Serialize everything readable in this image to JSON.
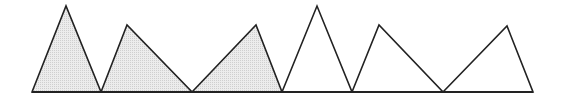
{
  "diagram": {
    "width": 562,
    "height": 105,
    "background": "#ffffff",
    "stroke_color": "#222222",
    "shaded_fill": "#e2e2e2",
    "unshaded_fill": "#ffffff",
    "baseline": {
      "x1": 32,
      "x2": 533,
      "y": 92
    },
    "triangles": [
      {
        "id": 1,
        "shaded": true,
        "points": [
          [
            32,
            92
          ],
          [
            66,
            6
          ],
          [
            101,
            92
          ]
        ]
      },
      {
        "id": 2,
        "shaded": true,
        "points": [
          [
            101,
            92
          ],
          [
            127,
            25
          ],
          [
            192,
            92
          ]
        ]
      },
      {
        "id": 3,
        "shaded": true,
        "points": [
          [
            192,
            92
          ],
          [
            256,
            25
          ],
          [
            282,
            92
          ]
        ]
      },
      {
        "id": 4,
        "shaded": false,
        "points": [
          [
            282,
            92
          ],
          [
            317,
            6
          ],
          [
            352,
            92
          ]
        ]
      },
      {
        "id": 5,
        "shaded": false,
        "points": [
          [
            352,
            92
          ],
          [
            379,
            25
          ],
          [
            443,
            92
          ]
        ]
      },
      {
        "id": 6,
        "shaded": false,
        "points": [
          [
            443,
            92
          ],
          [
            507,
            26
          ],
          [
            533,
            92
          ]
        ]
      }
    ]
  }
}
